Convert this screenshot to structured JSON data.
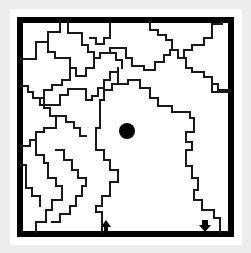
{
  "diagram": {
    "type": "maze",
    "description": "Square maze with stepped (staircase) wall lines, a black dot goal in the central region, an up-arrow entrance and a down-arrow exit along the bottom edge",
    "colors": {
      "background": "#ededed",
      "panel": "#ffffff",
      "frame": "#000000",
      "walls": "#1a1a1a",
      "markers": "#000000"
    },
    "markers": {
      "goal_dot": {
        "label": "goal dot",
        "x": 127,
        "y": 131,
        "radius": 8
      },
      "entry_arrow": {
        "label": "up arrow",
        "direction": "up",
        "x": 106,
        "y": 229
      },
      "exit_arrow": {
        "label": "down arrow",
        "direction": "down",
        "x": 205,
        "y": 227
      }
    },
    "frame": {
      "x": 20,
      "y": 20,
      "width": 211,
      "height": 214
    }
  }
}
